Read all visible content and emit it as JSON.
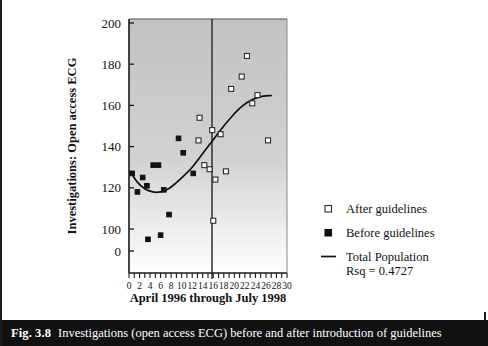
{
  "figure": {
    "caption_number": "Fig. 3.8",
    "caption_text": "Investigations (open access ECG) before and after introduction of guidelines"
  },
  "colors": {
    "plot_background_top": "#c2c2c2",
    "plot_background_bottom": "#ffffff",
    "axis": "#1a1a1a",
    "marker_before": "#111111",
    "marker_after": "#ffffff",
    "marker_after_edge": "#2b2b2b",
    "trend_line": "#111111",
    "divider_line": "#3a3a3a",
    "caption_bar": "#111111",
    "caption_text": "#ffffff"
  },
  "chart_data": {
    "type": "scatter",
    "title": "",
    "xlabel": "April 1996 through July 1998",
    "ylabel": "Investigations: Open access ECG",
    "xlim": [
      0,
      30
    ],
    "ylim": [
      0,
      200
    ],
    "grid": false,
    "y_axis_break": true,
    "xticks": [
      0,
      2,
      4,
      6,
      8,
      10,
      12,
      14,
      16,
      18,
      20,
      22,
      24,
      26,
      28,
      30
    ],
    "xtick_labels": [
      "0",
      "2",
      "4",
      "6",
      "8",
      "10",
      "12",
      "14",
      "16",
      "18",
      "20",
      "22",
      "24",
      "26",
      "28",
      "30"
    ],
    "xtick_minor_step": 1,
    "yticks": [
      0,
      100,
      120,
      140,
      160,
      180,
      200
    ],
    "ytick_labels": [
      "0",
      "100",
      "120",
      "140",
      "160",
      "180",
      "200"
    ],
    "guideline_marker_x": 12.8,
    "legend_position": "right",
    "series": [
      {
        "name": "Before guidelines",
        "marker": "filled-square",
        "points": [
          {
            "x": 0.6,
            "y": 127
          },
          {
            "x": 1.6,
            "y": 118
          },
          {
            "x": 2.6,
            "y": 125
          },
          {
            "x": 3.4,
            "y": 121
          },
          {
            "x": 3.6,
            "y": 95
          },
          {
            "x": 4.6,
            "y": 131
          },
          {
            "x": 5.6,
            "y": 131
          },
          {
            "x": 6.0,
            "y": 97
          },
          {
            "x": 6.6,
            "y": 119
          },
          {
            "x": 7.6,
            "y": 107
          },
          {
            "x": 9.4,
            "y": 144
          },
          {
            "x": 10.3,
            "y": 137
          },
          {
            "x": 12.2,
            "y": 127
          }
        ]
      },
      {
        "name": "After guidelines",
        "marker": "open-square",
        "points": [
          {
            "x": 13.2,
            "y": 143
          },
          {
            "x": 13.4,
            "y": 154
          },
          {
            "x": 14.3,
            "y": 131
          },
          {
            "x": 15.3,
            "y": 129
          },
          {
            "x": 15.8,
            "y": 148
          },
          {
            "x": 16.4,
            "y": 124
          },
          {
            "x": 16.0,
            "y": 104
          },
          {
            "x": 17.4,
            "y": 146
          },
          {
            "x": 18.4,
            "y": 128
          },
          {
            "x": 19.4,
            "y": 168
          },
          {
            "x": 21.4,
            "y": 174
          },
          {
            "x": 22.4,
            "y": 184
          },
          {
            "x": 23.4,
            "y": 161
          },
          {
            "x": 24.4,
            "y": 165
          },
          {
            "x": 26.4,
            "y": 143
          }
        ]
      }
    ],
    "trend": {
      "name": "Total Population",
      "rsq_label": "Rsq = 0.4727",
      "rsq_value": 0.4727,
      "points": [
        {
          "x": 0.3,
          "y": 128
        },
        {
          "x": 1.5,
          "y": 123
        },
        {
          "x": 3.0,
          "y": 119.5
        },
        {
          "x": 4.5,
          "y": 118
        },
        {
          "x": 6.0,
          "y": 118
        },
        {
          "x": 7.5,
          "y": 119.5
        },
        {
          "x": 9.0,
          "y": 122.5
        },
        {
          "x": 10.5,
          "y": 126
        },
        {
          "x": 12.0,
          "y": 130
        },
        {
          "x": 13.5,
          "y": 135
        },
        {
          "x": 15.0,
          "y": 140
        },
        {
          "x": 16.5,
          "y": 145
        },
        {
          "x": 18.0,
          "y": 150
        },
        {
          "x": 19.5,
          "y": 154.5
        },
        {
          "x": 21.0,
          "y": 158.5
        },
        {
          "x": 22.5,
          "y": 161.5
        },
        {
          "x": 24.0,
          "y": 163.5
        },
        {
          "x": 25.5,
          "y": 164.5
        },
        {
          "x": 27.0,
          "y": 164.8
        }
      ]
    }
  },
  "legend": {
    "items": [
      {
        "label": "After guidelines",
        "marker": "open-square"
      },
      {
        "label": "Before guidelines",
        "marker": "filled-square"
      },
      {
        "label": "Total Population",
        "marker": "line"
      }
    ],
    "rsq_text": "Rsq = 0.4727"
  }
}
